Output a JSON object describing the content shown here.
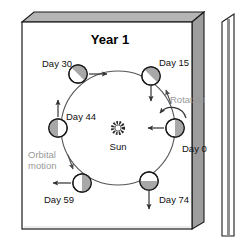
{
  "figure": {
    "title": "Year 1",
    "sun_label": "Sun",
    "rotation_label": "Rotation",
    "orbital_label_line1": "Orbital",
    "orbital_label_line2": "motion",
    "colors": {
      "panel_face": "#ffffff",
      "panel_side": "#9d9d9d",
      "panel_top": "#b5b5b5",
      "outline": "#1a1a1a",
      "orbit_line": "#555555",
      "planet_shade": "#a8a8a8",
      "planet_light": "#ffffff",
      "gray_text": "#9a9a9a",
      "sun_color": "#333333"
    },
    "orbit": {
      "center_x": 118,
      "center_y": 128,
      "radius": 57
    },
    "planets": [
      {
        "label": "Day 0",
        "angle_deg": 0,
        "cx": 175,
        "cy": 128,
        "shade": "right",
        "arrow": "left",
        "label_x": 182,
        "label_y": 152
      },
      {
        "label": "Day 15",
        "angle_deg": 305,
        "cx": 151,
        "cy": 76,
        "shade": "upper-left",
        "arrow": "down",
        "label_x": 159,
        "label_y": 66
      },
      {
        "label": "Day 30",
        "angle_deg": 238,
        "cx": 78,
        "cy": 74,
        "shade": "upper-left",
        "arrow": "right",
        "label_x": 42,
        "label_y": 67
      },
      {
        "label": "Day 44",
        "angle_deg": 180,
        "cx": 58,
        "cy": 128,
        "shade": "left",
        "arrow": "up",
        "label_x": 66,
        "label_y": 120
      },
      {
        "label": "Day 59",
        "angle_deg": 123,
        "cx": 82,
        "cy": 183,
        "shade": "right",
        "arrow": "left",
        "label_x": 44,
        "label_y": 203
      },
      {
        "label": "Day 74",
        "angle_deg": 58,
        "cx": 149,
        "cy": 181,
        "shade": "bottom",
        "arrow": "down",
        "label_x": 159,
        "label_y": 203
      }
    ]
  }
}
